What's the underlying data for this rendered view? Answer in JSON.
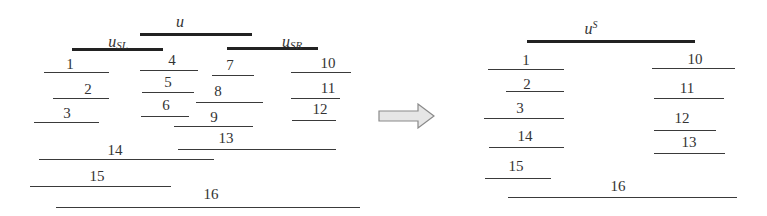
{
  "diagram": {
    "left_panel": {
      "parents": [
        {
          "id": "u",
          "label": "u",
          "sub": "",
          "x1": 140,
          "x2": 252,
          "y": 34,
          "lx": 180,
          "ly": 14
        },
        {
          "id": "u_SL",
          "label": "u",
          "sub": "SL",
          "x1": 72,
          "x2": 163,
          "y": 49,
          "lx": 118,
          "ly": 34
        },
        {
          "id": "u_SR",
          "label": "u",
          "sub": "SR",
          "x1": 227,
          "x2": 318,
          "y": 48,
          "lx": 292,
          "ly": 34
        }
      ],
      "segments": [
        {
          "label": "1",
          "x1": 44,
          "x2": 109,
          "y": 72,
          "lx": 70,
          "ly": 57
        },
        {
          "label": "2",
          "x1": 53,
          "x2": 109,
          "y": 98,
          "lx": 88,
          "ly": 82
        },
        {
          "label": "3",
          "x1": 34,
          "x2": 99,
          "y": 122,
          "lx": 67,
          "ly": 106
        },
        {
          "label": "4",
          "x1": 140,
          "x2": 198,
          "y": 70,
          "lx": 172,
          "ly": 53
        },
        {
          "label": "5",
          "x1": 142,
          "x2": 194,
          "y": 92,
          "lx": 168,
          "ly": 75
        },
        {
          "label": "6",
          "x1": 141,
          "x2": 189,
          "y": 116,
          "lx": 166,
          "ly": 98
        },
        {
          "label": "7",
          "x1": 212,
          "x2": 254,
          "y": 75,
          "lx": 230,
          "ly": 58
        },
        {
          "label": "8",
          "x1": 196,
          "x2": 263,
          "y": 102,
          "lx": 218,
          "ly": 84
        },
        {
          "label": "9",
          "x1": 174,
          "x2": 253,
          "y": 126,
          "lx": 214,
          "ly": 110
        },
        {
          "label": "10",
          "x1": 291,
          "x2": 351,
          "y": 72,
          "lx": 328,
          "ly": 56
        },
        {
          "label": "11",
          "x1": 291,
          "x2": 340,
          "y": 98,
          "lx": 328,
          "ly": 81
        },
        {
          "label": "12",
          "x1": 292,
          "x2": 336,
          "y": 120,
          "lx": 320,
          "ly": 102
        },
        {
          "label": "13",
          "x1": 178,
          "x2": 336,
          "y": 149,
          "lx": 226,
          "ly": 131
        },
        {
          "label": "14",
          "x1": 39,
          "x2": 214,
          "y": 159,
          "lx": 115,
          "ly": 143
        },
        {
          "label": "15",
          "x1": 30,
          "x2": 171,
          "y": 186,
          "lx": 97,
          "ly": 169
        },
        {
          "label": "16",
          "x1": 56,
          "x2": 360,
          "y": 207,
          "lx": 211,
          "ly": 187
        }
      ]
    },
    "arrow": {
      "direction": "right",
      "fill": "#e6e6e6",
      "stroke": "#8a8a8a"
    },
    "right_panel": {
      "parents": [
        {
          "id": "u_S",
          "label": "u",
          "sup": "S",
          "x1": 527,
          "x2": 695,
          "y": 41,
          "lx": 591,
          "ly": 20
        }
      ],
      "segments": [
        {
          "label": "1",
          "x1": 488,
          "x2": 564,
          "y": 69,
          "lx": 526,
          "ly": 53
        },
        {
          "label": "2",
          "x1": 506,
          "x2": 564,
          "y": 91,
          "lx": 527,
          "ly": 77
        },
        {
          "label": "3",
          "x1": 484,
          "x2": 564,
          "y": 118,
          "lx": 520,
          "ly": 101
        },
        {
          "label": "14",
          "x1": 489,
          "x2": 564,
          "y": 147,
          "lx": 525,
          "ly": 129
        },
        {
          "label": "15",
          "x1": 485,
          "x2": 551,
          "y": 178,
          "lx": 516,
          "ly": 159
        },
        {
          "label": "16",
          "x1": 508,
          "x2": 737,
          "y": 197,
          "lx": 618,
          "ly": 179
        },
        {
          "label": "10",
          "x1": 652,
          "x2": 735,
          "y": 68,
          "lx": 695,
          "ly": 52
        },
        {
          "label": "11",
          "x1": 654,
          "x2": 724,
          "y": 98,
          "lx": 687,
          "ly": 81
        },
        {
          "label": "12",
          "x1": 654,
          "x2": 716,
          "y": 130,
          "lx": 682,
          "ly": 111
        },
        {
          "label": "13",
          "x1": 654,
          "x2": 725,
          "y": 153,
          "lx": 689,
          "ly": 135
        }
      ]
    }
  }
}
